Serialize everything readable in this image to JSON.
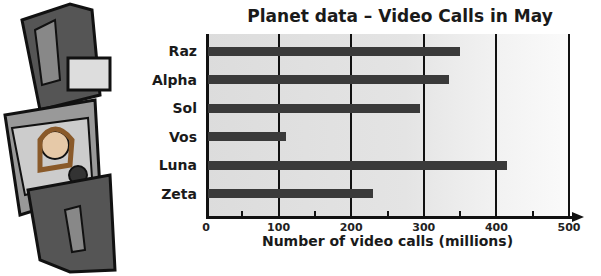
{
  "chart_data": {
    "type": "bar",
    "orientation": "horizontal",
    "title": "Planet data – Video Calls in May",
    "xlabel": "Number of video calls (millions)",
    "ylabel": "",
    "categories": [
      "Raz",
      "Alpha",
      "Sol",
      "Vos",
      "Luna",
      "Zeta"
    ],
    "values": [
      350,
      335,
      295,
      110,
      415,
      230
    ],
    "xlim": [
      0,
      500
    ],
    "xticks": [
      "0",
      "100",
      "200",
      "300",
      "400",
      "500"
    ],
    "minor_ticks": [
      50,
      150,
      250,
      350,
      450
    ],
    "grid": true,
    "bar_color": "#3a3a3a"
  },
  "illustration": "wrist video-watch showing a woman's face"
}
